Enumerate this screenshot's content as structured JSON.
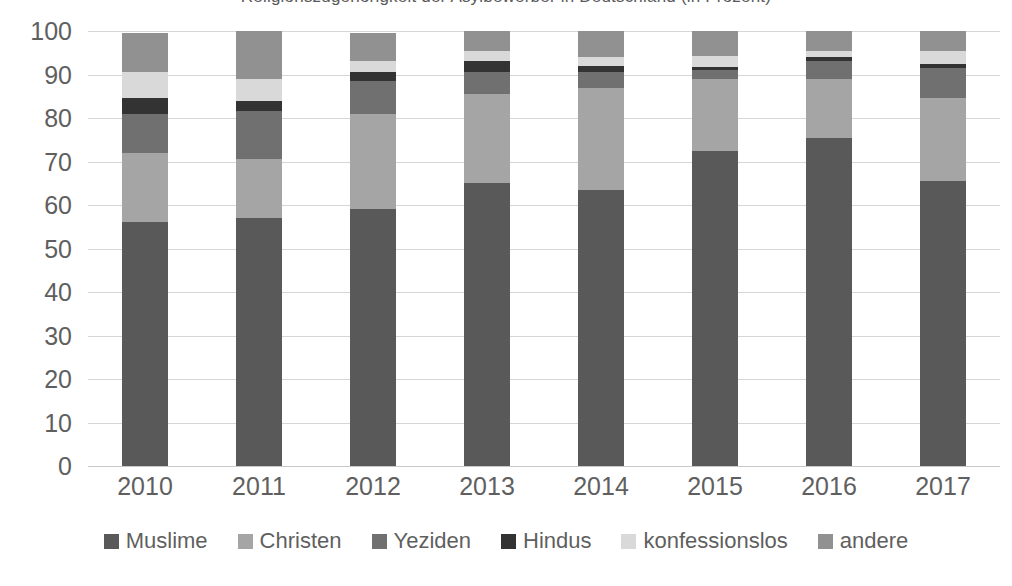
{
  "chart_data": {
    "type": "bar",
    "subtype": "stacked-100-percent",
    "title": "Religionszugehörigkeit der Asylbewerber in Deutschland (in Prozent)",
    "xlabel": "",
    "ylabel": "",
    "ylim": [
      0,
      100
    ],
    "ytick_step": 10,
    "grid": true,
    "legend_position": "bottom",
    "categories": [
      "2010",
      "2011",
      "2012",
      "2013",
      "2014",
      "2015",
      "2016",
      "2017"
    ],
    "ytick_labels": [
      "100",
      "90",
      "80",
      "70",
      "60",
      "50",
      "40",
      "30",
      "20",
      "10",
      "0"
    ],
    "series": [
      {
        "name": "Muslime",
        "color": "#595959",
        "values": [
          56.0,
          57.0,
          59.0,
          65.0,
          63.5,
          72.5,
          75.5,
          65.5
        ]
      },
      {
        "name": "Christen",
        "color": "#a5a5a5",
        "values": [
          16.0,
          13.5,
          22.0,
          20.5,
          23.5,
          16.5,
          13.5,
          19.0
        ]
      },
      {
        "name": "Yeziden",
        "color": "#707070",
        "values": [
          9.0,
          11.0,
          7.5,
          5.0,
          3.5,
          2.0,
          4.0,
          7.0
        ]
      },
      {
        "name": "Hindus",
        "color": "#333333",
        "values": [
          3.5,
          2.5,
          2.0,
          2.5,
          1.5,
          0.7,
          1.0,
          1.0
        ]
      },
      {
        "name": "konfessionslos",
        "color": "#d9d9d9",
        "values": [
          6.0,
          5.0,
          2.5,
          2.5,
          2.0,
          2.5,
          1.5,
          3.0
        ]
      },
      {
        "name": "andere",
        "color": "#919191",
        "values": [
          9.0,
          11.0,
          6.5,
          4.5,
          6.0,
          5.8,
          4.5,
          4.5
        ]
      }
    ]
  },
  "legend": {
    "items": [
      {
        "label": "Muslime",
        "color": "#595959"
      },
      {
        "label": "Christen",
        "color": "#a5a5a5"
      },
      {
        "label": "Yeziden",
        "color": "#707070"
      },
      {
        "label": "Hindus",
        "color": "#333333"
      },
      {
        "label": "konfessionslos",
        "color": "#d9d9d9"
      },
      {
        "label": "andere",
        "color": "#919191"
      }
    ]
  },
  "colors": {
    "gridline": "#d6d6d6",
    "axis_line": "#c9c9c9",
    "tick_text": "#5f5f5f",
    "background": "#ffffff"
  }
}
